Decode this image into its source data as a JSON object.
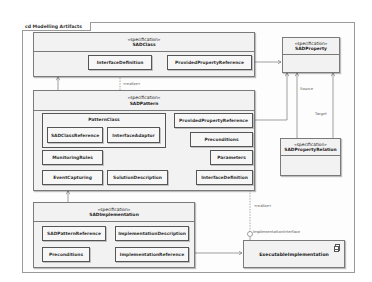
{
  "frame": {
    "label": "cd Modelling Artifacts"
  },
  "classes": {
    "sad_class": {
      "stereotype": "«specification»",
      "name": "SADClass",
      "parts": [
        "InterfaceDefinition",
        "ProvidedPropertyReference"
      ]
    },
    "sad_property": {
      "stereotype": "«specification»",
      "name": "SADProperty"
    },
    "sad_pattern": {
      "stereotype": "«specification»",
      "name": "SADPattern",
      "pattern_class": {
        "title": "PatternClass",
        "parts": [
          "SADClassReference",
          "InterfaceAdaptor"
        ]
      },
      "parts": {
        "provided_property_reference": "ProvidedPropertyReference",
        "preconditions": "Preconditions",
        "monitoring_rules": "MonitoringRules",
        "parameters": "Parameters",
        "event_capturing": "EventCapturing",
        "solution_description": "SolutionDescription",
        "interface_definition": "InterfaceDefinition"
      }
    },
    "sad_property_relation": {
      "stereotype": "«specification»",
      "name": "SADPropertyRelation"
    },
    "sad_implementation": {
      "stereotype": "«specification»",
      "name": "SADImplementation",
      "parts": {
        "pattern_reference": "SADPatternReference",
        "implementation_description": "ImplementationDescription",
        "preconditions": "Preconditions",
        "implementation_reference": "ImplementationReference"
      }
    },
    "executable_implementation": {
      "name": "ExecutableImplementation",
      "icon": "component-icon"
    }
  },
  "connector_labels": {
    "realize_1": "«realize»",
    "realize_2": "«realize»",
    "source": "Source",
    "target": "Target",
    "implementation_interface": "ImplementationInterface"
  }
}
